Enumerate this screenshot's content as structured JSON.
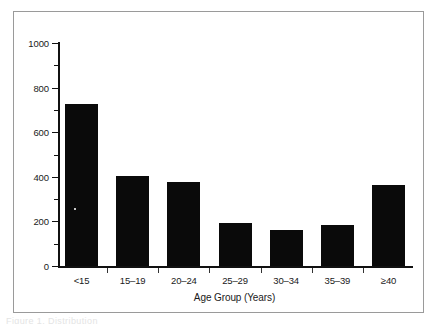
{
  "figure": {
    "frame_border_color": "#9a9a9a",
    "background_color": "#ffffff",
    "caption_remnant": "Figure 1. Distribution"
  },
  "chart_data": {
    "type": "bar",
    "title": "",
    "subtitle": "",
    "xlabel": "Age Group (Years)",
    "ylabel": "",
    "categories": [
      "<15",
      "15–19",
      "20–24",
      "25–29",
      "30–34",
      "35–39",
      "≥40"
    ],
    "values": [
      725,
      405,
      375,
      195,
      160,
      182,
      365
    ],
    "series": [
      {
        "name": "Count",
        "values": [
          725,
          405,
          375,
          195,
          160,
          182,
          365
        ]
      }
    ],
    "ylim": [
      0,
      1000
    ],
    "y_major_ticks": [
      0,
      200,
      400,
      600,
      800,
      1000
    ],
    "y_major_tick_labels": [
      "0",
      "200",
      "400",
      "600",
      "800",
      "1000"
    ],
    "y_minor_ticks": [
      100,
      300,
      500,
      700,
      900
    ],
    "grid": false,
    "legend": null,
    "legend_position": "none",
    "bar_color": "#0a0a0a",
    "axis_color": "#111111",
    "annotations": []
  }
}
